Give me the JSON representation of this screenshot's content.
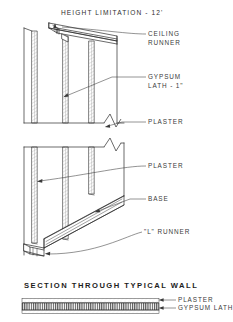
{
  "drawing": {
    "title": "HEIGHT   LIMITATION - 12'",
    "bottom_title": "SECTION   THROUGH   TYPICAL   WALL",
    "line_color": "#2b2b2b",
    "hatch_color": "#555555",
    "background": "#ffffff"
  },
  "callouts": [
    {
      "id": "ceiling-runner",
      "line1": "CEILING",
      "line2": "RUNNER"
    },
    {
      "id": "gypsum-lath",
      "line1": "GYPSUM",
      "line2": "LATH - 1\""
    },
    {
      "id": "plaster-upper",
      "line1": "PLASTER",
      "line2": ""
    },
    {
      "id": "plaster-lower",
      "line1": "PLASTER",
      "line2": ""
    },
    {
      "id": "base",
      "line1": "BASE",
      "line2": ""
    },
    {
      "id": "l-runner",
      "line1": "\"L\"  RUNNER",
      "line2": ""
    }
  ],
  "section_callouts": [
    {
      "id": "section-plaster",
      "label": "PLASTER"
    },
    {
      "id": "section-gypsum-lath",
      "label": "GYPSUM   LATH"
    }
  ]
}
